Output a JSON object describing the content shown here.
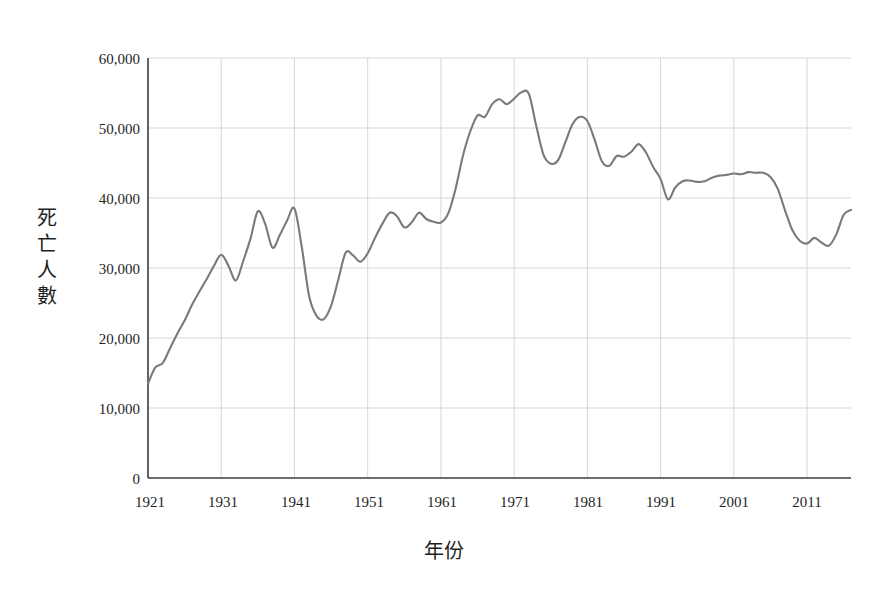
{
  "figure": {
    "caption_strip": "",
    "background_color": "#ffffff",
    "line_color": "#7a7a7a",
    "axis_color": "#3c3c3c",
    "grid_color": "#d7d7d7",
    "text_color": "#1f1f1f"
  },
  "axes": {
    "y_title": "死亡人數",
    "y_title_chars": [
      "死",
      "亡",
      "人",
      "數"
    ],
    "x_title": "年份",
    "y_ticks": [
      "0",
      "10,000",
      "20,000",
      "30,000",
      "40,000",
      "50,000",
      "60,000"
    ],
    "x_ticks": [
      "1921",
      "1931",
      "1941",
      "1951",
      "1961",
      "1971",
      "1981",
      "1991",
      "2001",
      "2011"
    ]
  },
  "chart_data": {
    "type": "line",
    "title": "",
    "xlabel": "年份",
    "ylabel": "死亡人數",
    "xlim": [
      1921,
      2017
    ],
    "ylim": [
      0,
      60000
    ],
    "ytick_values": [
      0,
      10000,
      20000,
      30000,
      40000,
      50000,
      60000
    ],
    "xtick_values": [
      1921,
      1931,
      1941,
      1951,
      1961,
      1971,
      1981,
      1991,
      2001,
      2011
    ],
    "grid": true,
    "legend": null,
    "series": [
      {
        "name": "死亡人數",
        "color": "#7a7a7a",
        "x": [
          1921,
          1922,
          1923,
          1924,
          1925,
          1926,
          1927,
          1928,
          1929,
          1930,
          1931,
          1932,
          1933,
          1934,
          1935,
          1936,
          1937,
          1938,
          1939,
          1940,
          1941,
          1942,
          1943,
          1944,
          1945,
          1946,
          1947,
          1948,
          1949,
          1950,
          1951,
          1952,
          1953,
          1954,
          1955,
          1956,
          1957,
          1958,
          1959,
          1960,
          1961,
          1962,
          1963,
          1964,
          1965,
          1966,
          1967,
          1968,
          1969,
          1970,
          1971,
          1972,
          1973,
          1974,
          1975,
          1976,
          1977,
          1978,
          1979,
          1980,
          1981,
          1982,
          1983,
          1984,
          1985,
          1986,
          1987,
          1988,
          1989,
          1990,
          1991,
          1992,
          1993,
          1994,
          1995,
          1996,
          1997,
          1998,
          1999,
          2000,
          2001,
          2002,
          2003,
          2004,
          2005,
          2006,
          2007,
          2008,
          2009,
          2010,
          2011,
          2012,
          2013,
          2014,
          2015,
          2016,
          2017
        ],
        "values": [
          13500,
          15800,
          16400,
          18500,
          20600,
          22500,
          24700,
          26600,
          28400,
          30300,
          31900,
          30300,
          28200,
          31000,
          34200,
          38100,
          36300,
          32900,
          34700,
          36800,
          38500,
          33000,
          26000,
          23200,
          22700,
          24600,
          28400,
          32200,
          31800,
          30900,
          32100,
          34300,
          36300,
          37900,
          37400,
          35800,
          36500,
          37900,
          37000,
          36600,
          36500,
          37800,
          41300,
          46000,
          49500,
          51800,
          51600,
          53400,
          54100,
          53400,
          54200,
          55100,
          54900,
          50400,
          46200,
          44900,
          45400,
          48000,
          50600,
          51600,
          51000,
          48300,
          45200,
          44600,
          46000,
          45900,
          46600,
          47700,
          46500,
          44400,
          42700,
          39800,
          41500,
          42400,
          42500,
          42300,
          42400,
          42900,
          43200,
          43300,
          43500,
          43400,
          43700,
          43600,
          43600,
          43000,
          41300,
          38200,
          35400,
          33900,
          33500,
          34300,
          33600,
          33200,
          34800,
          37600,
          38300
        ]
      }
    ]
  }
}
